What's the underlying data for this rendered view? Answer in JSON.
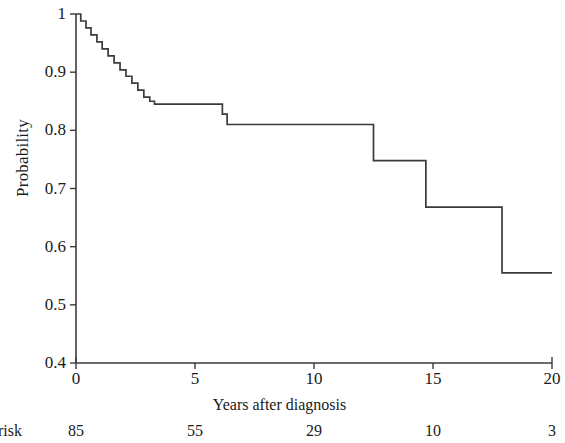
{
  "chart_data": {
    "type": "line",
    "subtype": "kaplan-meier-step",
    "title": "",
    "xlabel": "Years after diagnosis",
    "ylabel": "Probability",
    "xlim": [
      0,
      20
    ],
    "ylim": [
      0.4,
      1.0
    ],
    "grid": false,
    "legend": null,
    "xticks": [
      {
        "value": 0,
        "label": "0"
      },
      {
        "value": 5,
        "label": "5"
      },
      {
        "value": 10,
        "label": "10"
      },
      {
        "value": 15,
        "label": "15"
      },
      {
        "value": 20,
        "label": "20"
      }
    ],
    "yticks": [
      {
        "value": 1.0,
        "label": "1"
      },
      {
        "value": 0.9,
        "label": "0.9"
      },
      {
        "value": 0.8,
        "label": "0.8"
      },
      {
        "value": 0.7,
        "label": "0.7"
      },
      {
        "value": 0.6,
        "label": "0.6"
      },
      {
        "value": 0.5,
        "label": "0.5"
      },
      {
        "value": 0.4,
        "label": "0.4"
      }
    ],
    "line_color": "#3b3b3b",
    "series": [
      {
        "name": "Survival probability",
        "step": "post",
        "x": [
          0.0,
          0.2,
          0.42,
          0.63,
          0.88,
          1.1,
          1.35,
          1.6,
          1.85,
          2.1,
          2.35,
          2.6,
          2.85,
          3.1,
          3.3,
          6.15,
          6.35,
          12.5,
          14.7,
          17.9,
          20.0
        ],
        "y": [
          1.0,
          0.988,
          0.976,
          0.964,
          0.952,
          0.94,
          0.928,
          0.916,
          0.904,
          0.893,
          0.881,
          0.869,
          0.857,
          0.85,
          0.845,
          0.828,
          0.81,
          0.748,
          0.668,
          0.555,
          0.555
        ]
      }
    ],
    "at_risk": {
      "caption": "risk",
      "times": [
        0,
        5,
        10,
        15,
        20
      ],
      "counts": [
        "85",
        "55",
        "29",
        "10",
        "3"
      ]
    }
  },
  "axis": {
    "y_label": "Probability",
    "x_label": "Years after diagnosis"
  }
}
